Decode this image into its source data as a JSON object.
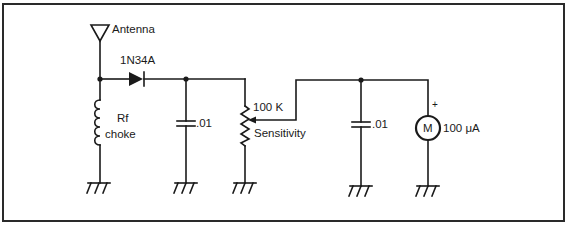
{
  "diagram": {
    "type": "circuit-schematic",
    "components": {
      "antenna": {
        "label": "Antenna"
      },
      "diode": {
        "label": "1N34A"
      },
      "rf_choke": {
        "label_line1": "Rf",
        "label_line2": "choke"
      },
      "capacitor_1": {
        "label": ".01"
      },
      "potentiometer": {
        "value": "100 K",
        "label": "Sensitivity"
      },
      "capacitor_2": {
        "label": ".01"
      },
      "meter": {
        "symbol": "M",
        "value": "100 μA",
        "polarity": "+"
      }
    },
    "grounds": 5,
    "colors": {
      "line": "#1a1a1a",
      "background": "#ffffff"
    }
  }
}
